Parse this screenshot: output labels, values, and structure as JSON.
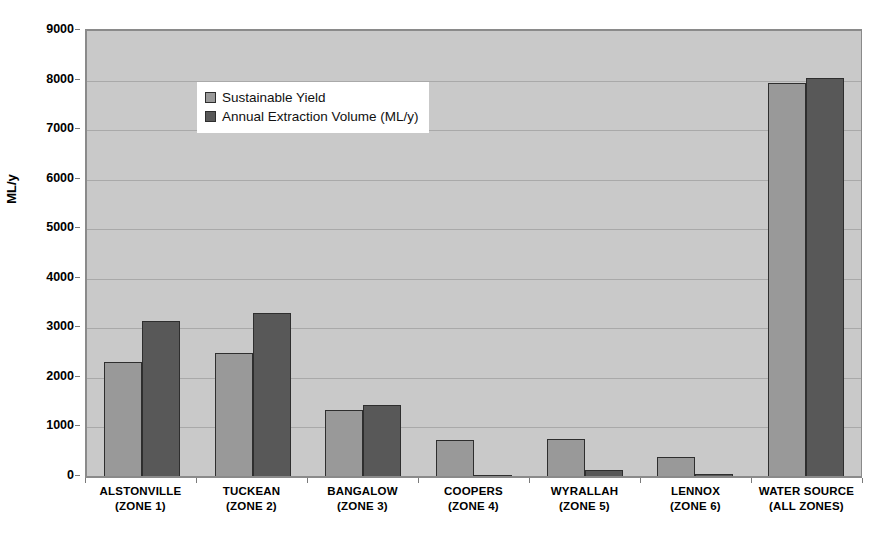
{
  "chart_data": {
    "type": "bar",
    "title": "",
    "xlabel": "",
    "ylabel": "ML/y",
    "ylim": [
      0,
      9000
    ],
    "ytick_step": 1000,
    "yticks": [
      "9000",
      "8000",
      "7000",
      "6000",
      "5000",
      "4000",
      "3000",
      "2000",
      "1000",
      "0"
    ],
    "grid": true,
    "legend_position": "top-left",
    "categories": [
      "ALSTONVILLE\n(ZONE 1)",
      "TUCKEAN\n(ZONE 2)",
      "BANGALOW\n(ZONE 3)",
      "COOPERS\n(ZONE 4)",
      "WYRALLAH\n(ZONE 5)",
      "LENNOX\n(ZONE 6)",
      "WATER SOURCE\n(ALL ZONES)"
    ],
    "category_lines": [
      [
        "ALSTONVILLE",
        "(ZONE 1)"
      ],
      [
        "TUCKEAN",
        "(ZONE 2)"
      ],
      [
        "BANGALOW",
        "(ZONE 3)"
      ],
      [
        "COOPERS",
        "(ZONE 4)"
      ],
      [
        "WYRALLAH",
        "(ZONE 5)"
      ],
      [
        "LENNOX",
        "(ZONE 6)"
      ],
      [
        "WATER SOURCE",
        "(ALL ZONES)"
      ]
    ],
    "series": [
      {
        "name": "Sustainable Yield",
        "color": "#999999",
        "values": [
          2310,
          2490,
          1330,
          720,
          740,
          380,
          7940
        ]
      },
      {
        "name": "Annual Extraction Volume (ML/y)",
        "color": "#585858",
        "values": [
          3130,
          3280,
          1440,
          30,
          130,
          50,
          8030
        ]
      }
    ]
  },
  "legend": {
    "items": [
      {
        "label": "Sustainable Yield",
        "swatch": "s1"
      },
      {
        "label": "Annual Extraction Volume (ML/y)",
        "swatch": "s2"
      }
    ]
  },
  "axes": {
    "y_title": "ML/y"
  },
  "colors": {
    "plot_background": "#c9c9c9",
    "gridline": "#a9a9a9",
    "axis": "#8a8a8a",
    "series_1": "#999999",
    "series_2": "#585858",
    "bar_outline": "#2e2e2e",
    "text": "#000000",
    "page_background": "#ffffff"
  }
}
